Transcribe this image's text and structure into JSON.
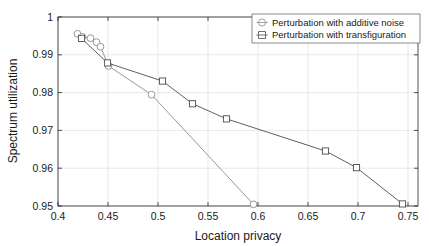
{
  "chart_data": {
    "type": "line",
    "title": "",
    "xlabel": "Location privacy",
    "ylabel": "Spectrum utilization",
    "xlim": [
      0.4,
      0.76
    ],
    "ylim": [
      0.95,
      1.0
    ],
    "xticks": [
      0.4,
      0.45,
      0.5,
      0.55,
      0.6,
      0.65,
      0.7,
      0.75
    ],
    "xticklabels": [
      "0.4",
      "0.45",
      "0.5",
      "0.55",
      "0.6",
      "0.65",
      "0.7",
      "0.75"
    ],
    "yticks": [
      0.95,
      0.96,
      0.97,
      0.98,
      0.99,
      1.0
    ],
    "yticklabels": [
      "0.95",
      "0.96",
      "0.97",
      "0.98",
      "0.99",
      "1"
    ],
    "grid": true,
    "legend_position": "top-right-inside",
    "series": [
      {
        "name": "Perturbation with additive noise",
        "marker": "circle",
        "color": "#8c8c8c",
        "x": [
          0.4195,
          0.4245,
          0.4325,
          0.4385,
          0.4425,
          0.4505,
          0.4935,
          0.5955
        ],
        "y": [
          0.99555,
          0.99475,
          0.9944,
          0.99335,
          0.99215,
          0.98705,
          0.97945,
          0.95045
        ]
      },
      {
        "name": "Perturbation with transfiguration",
        "marker": "square",
        "color": "#4d4d4d",
        "x": [
          0.4235,
          0.4495,
          0.5045,
          0.5345,
          0.5685,
          0.6675,
          0.6985,
          0.7445
        ],
        "y": [
          0.99435,
          0.98785,
          0.98305,
          0.97705,
          0.97305,
          0.96455,
          0.96015,
          0.95055
        ]
      }
    ]
  },
  "legend": {
    "entries": [
      {
        "label": "Perturbation with additive noise",
        "marker": "circle-with-line-icon"
      },
      {
        "label": "Perturbation with transfiguration",
        "marker": "square-with-line-icon"
      }
    ]
  },
  "colors": {
    "series_1": "#8c8c8c",
    "series_2": "#4d4d4d",
    "grid": "#d9d9d9",
    "axis": "#262626",
    "background": "#ffffff"
  }
}
